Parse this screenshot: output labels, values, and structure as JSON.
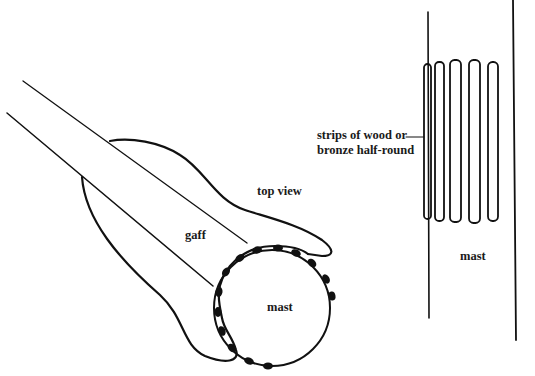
{
  "diagram": {
    "type": "technical-illustration",
    "left_figure": {
      "labels": {
        "top_view": "top view",
        "gaff": "gaff",
        "mast": "mast"
      }
    },
    "right_figure": {
      "labels": {
        "strips_line1": "strips of wood or",
        "strips_line2": "bronze half-round",
        "mast": "mast"
      },
      "strip_count": 5
    },
    "colors": {
      "ink": "#111111",
      "background": "#ffffff"
    }
  }
}
